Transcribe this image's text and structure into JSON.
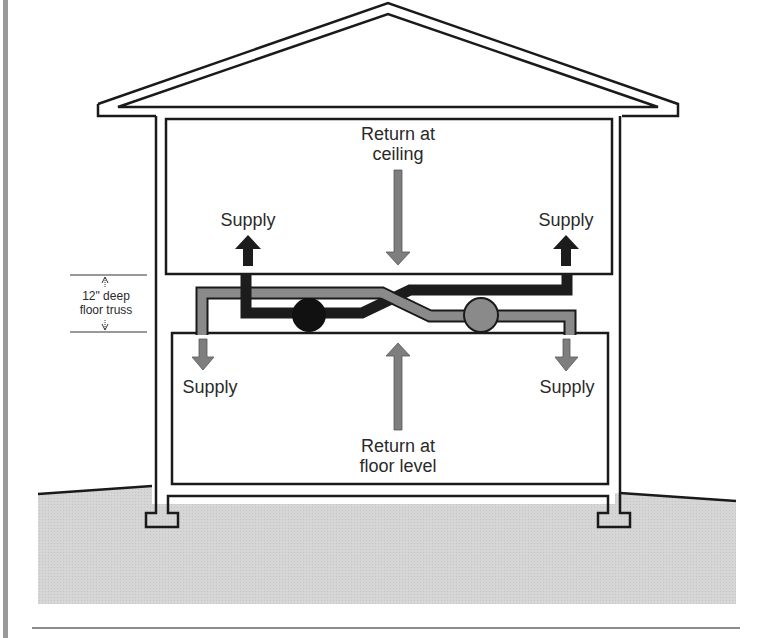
{
  "diagram": {
    "colors": {
      "outline": "#1a1a1a",
      "ground": "#d4d4d4",
      "supply_duct": "#1c1c1c",
      "return_duct": "#8a8a8a",
      "border_left": "#9a9a9a",
      "text": "#2a2a2a"
    },
    "labels": {
      "return_ceiling_line1": "Return at",
      "return_ceiling_line2": "ceiling",
      "return_floor_line1": "Return at",
      "return_floor_line2": "floor level",
      "supply_upper_left": "Supply",
      "supply_upper_right": "Supply",
      "supply_lower_left": "Supply",
      "supply_lower_right": "Supply",
      "truss_line1": "12\" deep",
      "truss_line2": "floor truss"
    },
    "components": [
      {
        "name": "roof",
        "type": "gable"
      },
      {
        "name": "upper-room",
        "type": "room"
      },
      {
        "name": "lower-room",
        "type": "room"
      },
      {
        "name": "floor-truss-space",
        "type": "cavity",
        "depth": "12\""
      },
      {
        "name": "supply-fan",
        "type": "air-handler",
        "fill": "dark"
      },
      {
        "name": "return-fan",
        "type": "air-handler",
        "fill": "gray"
      },
      {
        "name": "ground",
        "type": "terrain"
      },
      {
        "name": "footings",
        "count": 2
      }
    ]
  }
}
